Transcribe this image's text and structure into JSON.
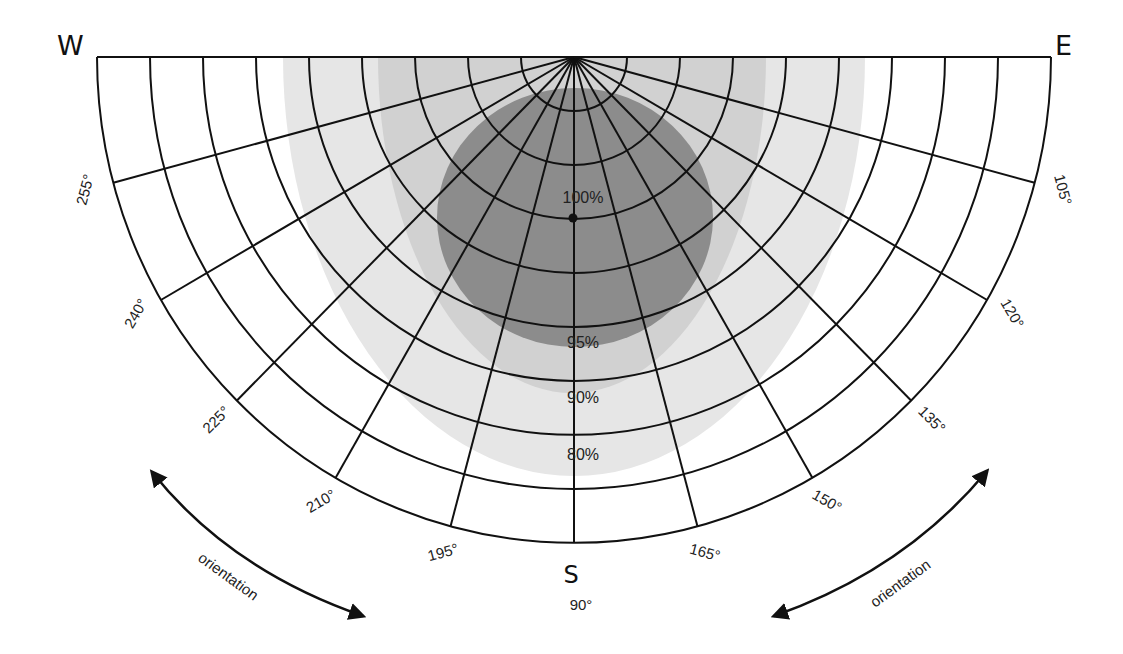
{
  "diagram": {
    "compass": {
      "west": "W",
      "east": "E",
      "south": "S"
    },
    "south_degree": "90°",
    "angle_labels": [
      {
        "label": "255°",
        "angle": 15,
        "side": "left"
      },
      {
        "label": "240°",
        "angle": 30,
        "side": "left"
      },
      {
        "label": "225°",
        "angle": 45,
        "side": "left"
      },
      {
        "label": "210°",
        "angle": 60,
        "side": "left"
      },
      {
        "label": "195°",
        "angle": 75,
        "side": "left"
      },
      {
        "label": "165°",
        "angle": 105,
        "side": "right"
      },
      {
        "label": "150°",
        "angle": 120,
        "side": "right"
      },
      {
        "label": "135°",
        "angle": 135,
        "side": "right"
      },
      {
        "label": "120°",
        "angle": 150,
        "side": "right"
      },
      {
        "label": "105°",
        "angle": 165,
        "side": "right"
      }
    ],
    "efficiency_zones": [
      {
        "label": "80%",
        "color": "#e6e6e6",
        "cx": 574,
        "top": 57,
        "rx": 291,
        "bottom": 476
      },
      {
        "label": "90%",
        "color": "#d1d1d1",
        "cx": 572,
        "top": 57,
        "rx": 194,
        "bottom": 393
      },
      {
        "label": "95%",
        "color": "#8c8c8c",
        "cx": 575,
        "top": 88,
        "rx": 138,
        "bottom": 347
      }
    ],
    "zone_labels": [
      {
        "text": "100%",
        "x": 583,
        "y": 203
      },
      {
        "text": "95%",
        "x": 583,
        "y": 348
      },
      {
        "text": "90%",
        "x": 583,
        "y": 403
      },
      {
        "text": "80%",
        "x": 583,
        "y": 460
      }
    ],
    "optimum_point": {
      "x": 573,
      "y": 218
    },
    "grid": {
      "center_x": 574,
      "center_y": 57,
      "outer_rx": 477,
      "outer_ry": 486,
      "rings": 9,
      "radial_step_deg": 15
    },
    "orientation_arrows": [
      {
        "label": "orientation",
        "side": "left"
      },
      {
        "label": "orientation",
        "side": "right"
      }
    ],
    "colors": {
      "line": "#111111",
      "background": "#ffffff"
    }
  }
}
